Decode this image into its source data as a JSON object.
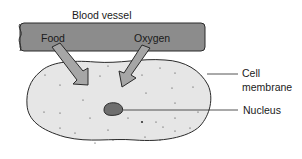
{
  "diagram": {
    "labels": {
      "blood_vessel": "Blood vessel",
      "food": "Food",
      "oxygen": "Oxygen",
      "cell_line1": "Cell",
      "cell_line2": "membrane",
      "nucleus": "Nucleus"
    },
    "colors": {
      "vessel_fill": "#8c8c8c",
      "arrow_fill": "#a6a6a6",
      "cell_fill": "#e6e6e6",
      "nucleus_fill": "#6e6e6e",
      "outline": "#2a2a2a"
    }
  }
}
